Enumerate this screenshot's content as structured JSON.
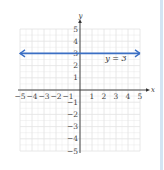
{
  "chart_data": {
    "type": "line",
    "title": "",
    "xlabel": "x",
    "ylabel": "y",
    "xlim": [
      -5,
      5
    ],
    "ylim": [
      -5,
      5
    ],
    "grid": true,
    "x_ticks": [
      -5,
      -4,
      -3,
      -2,
      -1,
      1,
      2,
      3,
      4,
      5
    ],
    "y_ticks": [
      -5,
      -4,
      -3,
      -2,
      -1,
      1,
      2,
      3,
      4,
      5
    ],
    "x_tick_labels": [
      "−5",
      "−4",
      "−3",
      "−2",
      "−1",
      "1",
      "2",
      "3",
      "4",
      "5"
    ],
    "y_tick_labels": [
      "−5",
      "−4",
      "−3",
      "−2",
      "−1",
      "1",
      "2",
      "3",
      "4",
      "5"
    ],
    "series": [
      {
        "name": "y = 3",
        "x": [
          -5,
          5
        ],
        "y": [
          3,
          3
        ],
        "arrows": "both",
        "color": "#3b6fc4"
      }
    ],
    "annotations": [
      {
        "text": "y = 3",
        "x": 2.1,
        "y": 2.35
      }
    ]
  },
  "colors": {
    "line": "#3b6fc4",
    "grid": "#e2e2e2",
    "axis": "#333333",
    "border": "#d4e4f3"
  }
}
